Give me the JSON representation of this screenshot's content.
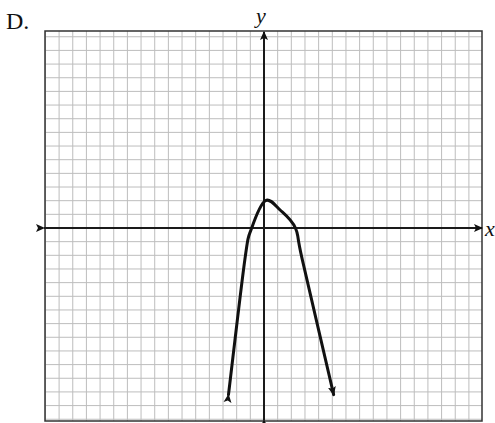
{
  "option_label": "D.",
  "chart_data": {
    "type": "line",
    "title": "",
    "xlabel": "x",
    "ylabel": "y",
    "grid": true,
    "xlim": [
      -16,
      16
    ],
    "ylim": [
      -14,
      14
    ],
    "grid_step": 1,
    "tick_labels": "none",
    "series": [
      {
        "name": "parabola (opens downward)",
        "shape": "downward-opening parabola with arrows at both ends",
        "vertex": [
          0.1,
          2
        ],
        "x_intercepts": [
          -0.9,
          2.3
        ],
        "points": [
          [
            -2.6,
            -12.2
          ],
          [
            -1.4,
            -2.3
          ],
          [
            -0.9,
            0
          ],
          [
            0.1,
            2
          ],
          [
            1.2,
            1.3
          ],
          [
            2.3,
            0
          ],
          [
            2.8,
            -2.3
          ],
          [
            5.1,
            -12.2
          ]
        ],
        "end_arrows": true
      }
    ]
  },
  "colors": {
    "grid": "#bdbdbd",
    "axis": "#1a1a1a",
    "curve": "#111111",
    "border": "#333333"
  }
}
